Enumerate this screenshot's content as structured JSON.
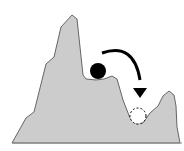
{
  "diagram": {
    "title": "",
    "colors": {
      "terrain_fill": "#cccccc",
      "terrain_stroke": "#666666",
      "ball": "#000000",
      "arrow": "#000000",
      "target_fill": "#ffffff",
      "target_stroke": "#000000"
    },
    "elements": {
      "terrain": "mountain-landscape",
      "ball": "ball-local-minimum",
      "arrow": "curved-arrow",
      "target": "global-minimum-dashed-circle"
    }
  }
}
